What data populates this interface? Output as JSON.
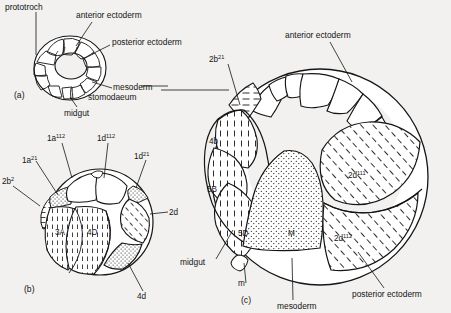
{
  "figure": {
    "background_color": "#f2f1ef",
    "ink_color": "#151515",
    "type": "biological-lineage-diagram"
  },
  "panels": [
    {
      "id": "a",
      "label": "(a)",
      "name": "panel-a-early-embryo",
      "callouts": [
        {
          "key": "prototroch",
          "text": "prototroch"
        },
        {
          "key": "anterior_ectoderm",
          "text": "anterior ectoderm"
        },
        {
          "key": "posterior_ectoderm",
          "text": "posterior ectoderm"
        },
        {
          "key": "mesoderm",
          "text": "mesoderm"
        },
        {
          "key": "midgut",
          "text": "midgut"
        },
        {
          "key": "stomodaeum",
          "text": "stomodaeum"
        }
      ]
    },
    {
      "id": "b",
      "label": "(b)",
      "name": "panel-b-cleavage-stage",
      "cell_labels": [
        {
          "key": "c1a112",
          "base": "1a",
          "sup": "112"
        },
        {
          "key": "c1d112",
          "base": "1d",
          "sup": "112"
        },
        {
          "key": "c1a21",
          "base": "1a",
          "sup": "21"
        },
        {
          "key": "c1d21",
          "base": "1d",
          "sup": "21"
        },
        {
          "key": "c2b2",
          "base": "2b",
          "sup": "2"
        },
        {
          "key": "c2d",
          "base": "2d",
          "sup": ""
        },
        {
          "key": "c4d",
          "base": "4d",
          "sup": ""
        },
        {
          "key": "c3A",
          "base": "3A",
          "sup": ""
        },
        {
          "key": "c4D",
          "base": "4D",
          "sup": ""
        }
      ]
    },
    {
      "id": "c",
      "label": "(c)",
      "name": "panel-c-late-embryo",
      "cell_labels": [
        {
          "key": "c2b21",
          "base": "2b",
          "sup": "21"
        },
        {
          "key": "c4b",
          "base": "4b",
          "sup": ""
        },
        {
          "key": "c5B",
          "base": "5B",
          "sup": ""
        },
        {
          "key": "c5D",
          "base": "5D",
          "sup": ""
        },
        {
          "key": "cM",
          "base": "M",
          "sup": ""
        },
        {
          "key": "c2d111",
          "base": "2d",
          "sup": "111"
        },
        {
          "key": "c2d112",
          "base": "2d",
          "sup": "112"
        },
        {
          "key": "cm",
          "base": "m",
          "sup": ""
        }
      ],
      "callouts": [
        {
          "key": "anterior_ectoderm",
          "text": "anterior ectoderm"
        },
        {
          "key": "posterior_ectoderm",
          "text": "posterior ectoderm"
        },
        {
          "key": "mesoderm",
          "text": "mesoderm"
        },
        {
          "key": "midgut",
          "text": "midgut"
        }
      ]
    }
  ],
  "texts": {
    "prototroch": "prototroch",
    "anterior_ectoderm": "anterior ectoderm",
    "posterior_ectoderm": "posterior ectoderm",
    "mesoderm": "mesoderm",
    "midgut": "midgut",
    "stomodaeum": "stomodaeum",
    "anterior_ectoderm_c": "anterior ectoderm",
    "posterior_ectoderm_c": "posterior ectoderm",
    "mesoderm_c": "mesoderm",
    "midgut_c": "midgut",
    "panel_a": "(a)",
    "panel_b": "(b)",
    "panel_c": "(c)",
    "b_1a112_base": "1a",
    "b_1a112_sup": "112",
    "b_1d112_base": "1d",
    "b_1d112_sup": "112",
    "b_1a21_base": "1a",
    "b_1a21_sup": "21",
    "b_1d21_base": "1d",
    "b_1d21_sup": "21",
    "b_2b2_base": "2b",
    "b_2b2_sup": "2",
    "b_2d": "2d",
    "b_4d": "4d",
    "b_3A": "3A",
    "b_4D": "4D",
    "c_2b21_base": "2b",
    "c_2b21_sup": "21",
    "c_4b": "4b",
    "c_5B": "5B",
    "c_5D": "5D",
    "c_M": "M",
    "c_m": "m",
    "c_2d111_base": "2d",
    "c_2d111_sup": "111",
    "c_2d112_base": "2d",
    "c_2d112_sup": "112"
  }
}
